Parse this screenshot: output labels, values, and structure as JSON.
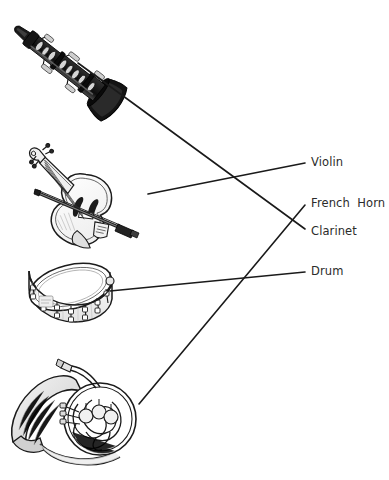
{
  "diagram": {
    "type": "matching-diagram",
    "background_color": "#ffffff",
    "ink_color": "#1a1a1a",
    "label_color": "#2b2b2b",
    "instruments": [
      {
        "id": "clarinet",
        "name": "clarinet-illustration",
        "position": "top-left"
      },
      {
        "id": "violin",
        "name": "violin-illustration",
        "position": "upper-left"
      },
      {
        "id": "drum",
        "name": "snare-drum-illustration",
        "position": "lower-left"
      },
      {
        "id": "french-horn",
        "name": "french-horn-illustration",
        "position": "bottom-left"
      }
    ],
    "labels": [
      {
        "id": "violin",
        "text": "Violin"
      },
      {
        "id": "french_horn",
        "text": "French  Horn"
      },
      {
        "id": "clarinet",
        "text": "Clarinet"
      },
      {
        "id": "drum",
        "text": "Drum"
      }
    ],
    "connectors": [
      {
        "id": "clarinet-line",
        "from": "clarinet-illustration",
        "to": "Clarinet",
        "x1": 78,
        "y1": 63,
        "x2": 305,
        "y2": 229
      },
      {
        "id": "violin-line",
        "from": "violin-illustration",
        "to": "Violin",
        "x1": 148,
        "y1": 194,
        "x2": 305,
        "y2": 163
      },
      {
        "id": "drum-line",
        "from": "snare-drum-illustration",
        "to": "Drum",
        "x1": 110,
        "y1": 291,
        "x2": 305,
        "y2": 272
      },
      {
        "id": "frenchhorn-line",
        "from": "french-horn-illustration",
        "to": "French  Horn",
        "x1": 139,
        "y1": 404,
        "x2": 305,
        "y2": 205
      }
    ]
  }
}
